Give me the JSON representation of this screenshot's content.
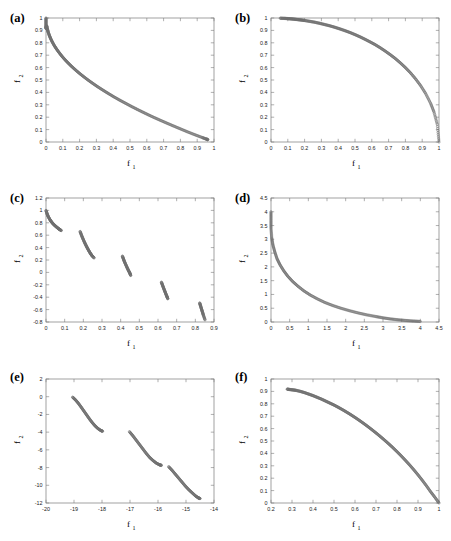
{
  "figure": {
    "caption_style": "six-panel pareto front scatter figure",
    "marker": {
      "shape": "open-circle",
      "color": "#6e6e6e",
      "radius": 1.15
    }
  },
  "panels": [
    {
      "tag": "(a)",
      "xlabel": "f",
      "xlabel_sub": "1",
      "ylabel": "f",
      "ylabel_sub": "2",
      "xticks": [
        "0",
        "0.1",
        "0.2",
        "0.3",
        "0.4",
        "0.5",
        "0.6",
        "0.7",
        "0.8",
        "0.9",
        "1"
      ],
      "yticks": [
        "0",
        "0.1",
        "0.2",
        "0.3",
        "0.4",
        "0.5",
        "0.6",
        "0.7",
        "0.8",
        "0.9",
        "1"
      ],
      "xlim": [
        0,
        1
      ],
      "ylim": [
        0,
        1
      ]
    },
    {
      "tag": "(b)",
      "xlabel": "f",
      "xlabel_sub": "1",
      "ylabel": "f",
      "ylabel_sub": "2",
      "xticks": [
        "0",
        "0.1",
        "0.2",
        "0.3",
        "0.4",
        "0.5",
        "0.6",
        "0.7",
        "0.8",
        "0.9",
        "1"
      ],
      "yticks": [
        "0",
        "0.1",
        "0.2",
        "0.3",
        "0.4",
        "0.5",
        "0.6",
        "0.7",
        "0.8",
        "0.9",
        "1"
      ],
      "xlim": [
        0,
        1
      ],
      "ylim": [
        0,
        1
      ]
    },
    {
      "tag": "(c)",
      "xlabel": "f",
      "xlabel_sub": "1",
      "ylabel": "f",
      "ylabel_sub": "2",
      "xticks": [
        "0",
        "0.1",
        "0.2",
        "0.3",
        "0.4",
        "0.5",
        "0.6",
        "0.7",
        "0.8",
        "0.9"
      ],
      "yticks": [
        "-0.8",
        "-0.6",
        "-0.4",
        "-0.2",
        "0",
        "0.2",
        "0.4",
        "0.6",
        "0.8",
        "1",
        "1.2"
      ],
      "xlim": [
        0,
        0.9
      ],
      "ylim": [
        -0.8,
        1.2
      ]
    },
    {
      "tag": "(d)",
      "xlabel": "f",
      "xlabel_sub": "1",
      "ylabel": "f",
      "ylabel_sub": "2",
      "xticks": [
        "0",
        "0.5",
        "1",
        "1.5",
        "2",
        "2.5",
        "3",
        "3.5",
        "4",
        "4.5"
      ],
      "yticks": [
        "0",
        "0.5",
        "1",
        "1.5",
        "2",
        "2.5",
        "3",
        "3.5",
        "4",
        "4.5"
      ],
      "xlim": [
        0,
        4.5
      ],
      "ylim": [
        0,
        4.5
      ]
    },
    {
      "tag": "(e)",
      "xlabel": "f",
      "xlabel_sub": "1",
      "ylabel": "f",
      "ylabel_sub": "2",
      "xticks": [
        "-20",
        "-19",
        "-18",
        "-17",
        "-16",
        "-15",
        "-14"
      ],
      "yticks": [
        "-12",
        "-10",
        "-8",
        "-6",
        "-4",
        "-2",
        "0",
        "2"
      ],
      "xlim": [
        -20,
        -14
      ],
      "ylim": [
        -12,
        2
      ]
    },
    {
      "tag": "(f)",
      "xlabel": "f",
      "xlabel_sub": "1",
      "ylabel": "f",
      "ylabel_sub": "2",
      "xticks": [
        "0.2",
        "0.3",
        "0.4",
        "0.5",
        "0.6",
        "0.7",
        "0.8",
        "0.9",
        "1"
      ],
      "yticks": [
        "0",
        "0.1",
        "0.2",
        "0.3",
        "0.4",
        "0.5",
        "0.6",
        "0.7",
        "0.8",
        "0.9",
        "1"
      ],
      "xlim": [
        0.2,
        1
      ],
      "ylim": [
        0,
        1
      ]
    }
  ],
  "chart_data": [
    {
      "type": "scatter",
      "panel": "(a)",
      "title": "",
      "xlabel": "f1",
      "ylabel": "f2",
      "xlim": [
        0,
        1
      ],
      "ylim": [
        0,
        1
      ],
      "grid": false,
      "legend": "none",
      "series": [
        {
          "name": "pareto-front-convex",
          "description": "convex decreasing front, f2 = 1 - sqrt(f1)",
          "x": [
            0.0,
            0.0,
            0.0,
            0.0,
            0.004,
            0.008,
            0.013,
            0.02,
            0.028,
            0.038,
            0.05,
            0.063,
            0.078,
            0.094,
            0.112,
            0.131,
            0.152,
            0.174,
            0.198,
            0.223,
            0.25,
            0.278,
            0.307,
            0.338,
            0.37,
            0.403,
            0.438,
            0.474,
            0.511,
            0.549,
            0.588,
            0.628,
            0.669,
            0.711,
            0.754,
            0.798,
            0.842,
            0.887,
            0.93,
            0.955,
            0.963
          ],
          "y": [
            1.0,
            0.97,
            0.94,
            0.915,
            0.937,
            0.911,
            0.886,
            0.859,
            0.833,
            0.805,
            0.776,
            0.749,
            0.721,
            0.693,
            0.665,
            0.638,
            0.61,
            0.583,
            0.555,
            0.528,
            0.5,
            0.473,
            0.446,
            0.419,
            0.392,
            0.365,
            0.338,
            0.312,
            0.285,
            0.259,
            0.233,
            0.207,
            0.182,
            0.157,
            0.132,
            0.107,
            0.082,
            0.058,
            0.036,
            0.023,
            0.019
          ]
        }
      ]
    },
    {
      "type": "scatter",
      "panel": "(b)",
      "title": "",
      "xlabel": "f1",
      "ylabel": "f2",
      "xlim": [
        0,
        1
      ],
      "ylim": [
        0,
        1
      ],
      "grid": false,
      "legend": "none",
      "series": [
        {
          "name": "pareto-front-concave",
          "description": "concave front, f2 = sqrt(1 - f1^2), quarter circle",
          "x": [
            0.055,
            0.08,
            0.1,
            0.12,
            0.14,
            0.16,
            0.18,
            0.2,
            0.23,
            0.26,
            0.29,
            0.32,
            0.35,
            0.38,
            0.41,
            0.44,
            0.47,
            0.5,
            0.53,
            0.56,
            0.59,
            0.62,
            0.65,
            0.68,
            0.71,
            0.74,
            0.77,
            0.8,
            0.83,
            0.86,
            0.89,
            0.92,
            0.95,
            0.97,
            0.99,
            1.0
          ],
          "y": [
            0.998,
            0.997,
            0.995,
            0.993,
            0.99,
            0.987,
            0.984,
            0.98,
            0.973,
            0.966,
            0.957,
            0.947,
            0.937,
            0.925,
            0.912,
            0.898,
            0.883,
            0.866,
            0.848,
            0.828,
            0.807,
            0.785,
            0.76,
            0.733,
            0.704,
            0.673,
            0.638,
            0.6,
            0.558,
            0.51,
            0.456,
            0.392,
            0.312,
            0.243,
            0.141,
            0.0
          ]
        }
      ]
    },
    {
      "type": "scatter",
      "panel": "(c)",
      "title": "",
      "xlabel": "f1",
      "ylabel": "f2",
      "xlim": [
        0,
        0.9
      ],
      "ylim": [
        -0.8,
        1.2
      ],
      "grid": false,
      "legend": "none",
      "series": [
        {
          "name": "segment-1",
          "x": [
            0.0,
            0.006,
            0.012,
            0.02,
            0.028,
            0.036,
            0.045,
            0.054,
            0.063,
            0.072,
            0.0818
          ],
          "y": [
            1.0,
            0.944,
            0.9,
            0.856,
            0.82,
            0.79,
            0.763,
            0.738,
            0.715,
            0.694,
            0.6753
          ]
        },
        {
          "name": "segment-2",
          "x": [
            0.1827,
            0.19,
            0.198,
            0.206,
            0.214,
            0.222,
            0.23,
            0.238,
            0.246,
            0.2577
          ],
          "y": [
            0.6606,
            0.6,
            0.542,
            0.487,
            0.437,
            0.39,
            0.346,
            0.306,
            0.27,
            0.2338
          ]
        },
        {
          "name": "segment-3",
          "x": [
            0.4093,
            0.415,
            0.421,
            0.428,
            0.435,
            0.442,
            0.449,
            0.4538
          ],
          "y": [
            0.2625,
            0.215,
            0.168,
            0.121,
            0.074,
            0.029,
            -0.01,
            -0.0497
          ]
        },
        {
          "name": "segment-4",
          "x": [
            0.6183,
            0.624,
            0.63,
            0.636,
            0.642,
            0.648,
            0.6525
          ],
          "y": [
            -0.1576,
            -0.205,
            -0.253,
            -0.3,
            -0.346,
            -0.39,
            -0.4254
          ]
        },
        {
          "name": "segment-5",
          "x": [
            0.8233,
            0.828,
            0.833,
            0.838,
            0.843,
            0.8518
          ],
          "y": [
            -0.4929,
            -0.54,
            -0.59,
            -0.638,
            -0.688,
            -0.7655
          ]
        }
      ]
    },
    {
      "type": "scatter",
      "panel": "(d)",
      "title": "",
      "xlabel": "f1",
      "ylabel": "f2",
      "xlim": [
        0,
        4.5
      ],
      "ylim": [
        0,
        4.5
      ],
      "grid": false,
      "legend": "none",
      "series": [
        {
          "name": "pareto-front-hyperbolic",
          "description": "strongly convex decaying front",
          "x": [
            0.0,
            0.0,
            0.0,
            0.02,
            0.05,
            0.1,
            0.16,
            0.24,
            0.34,
            0.45,
            0.58,
            0.72,
            0.88,
            1.05,
            1.24,
            1.44,
            1.65,
            1.87,
            2.1,
            2.33,
            2.56,
            2.8,
            3.0,
            3.2,
            3.4,
            3.6,
            3.8,
            4.0
          ],
          "y": [
            4.0,
            3.7,
            3.4,
            3.05,
            2.8,
            2.55,
            2.3,
            2.08,
            1.86,
            1.66,
            1.47,
            1.3,
            1.13,
            0.98,
            0.84,
            0.71,
            0.6,
            0.5,
            0.41,
            0.33,
            0.26,
            0.2,
            0.15,
            0.11,
            0.08,
            0.055,
            0.035,
            0.02
          ]
        }
      ]
    },
    {
      "type": "scatter",
      "panel": "(e)",
      "title": "",
      "xlabel": "f1",
      "ylabel": "f2",
      "xlim": [
        -20,
        -14
      ],
      "ylim": [
        -12,
        2
      ],
      "grid": false,
      "legend": "none",
      "series": [
        {
          "name": "segment-1",
          "x": [
            -19.05,
            -18.95,
            -18.85,
            -18.75,
            -18.65,
            -18.55,
            -18.45,
            -18.35,
            -18.25,
            -18.15,
            -18.05,
            -17.98
          ],
          "y": [
            -0.05,
            -0.35,
            -0.72,
            -1.15,
            -1.6,
            -2.05,
            -2.5,
            -2.92,
            -3.28,
            -3.58,
            -3.8,
            -3.9
          ]
        },
        {
          "name": "segment-2",
          "x": [
            -17.02,
            -16.9,
            -16.78,
            -16.66,
            -16.54,
            -16.42,
            -16.3,
            -16.18,
            -16.06,
            -15.95,
            -15.88
          ],
          "y": [
            -3.95,
            -4.4,
            -4.9,
            -5.4,
            -5.9,
            -6.4,
            -6.85,
            -7.2,
            -7.5,
            -7.68,
            -7.75
          ]
        },
        {
          "name": "segment-3",
          "x": [
            -15.62,
            -15.5,
            -15.38,
            -15.26,
            -15.14,
            -15.02,
            -14.9,
            -14.78,
            -14.66,
            -14.56,
            -14.5
          ],
          "y": [
            -7.9,
            -8.3,
            -8.75,
            -9.2,
            -9.65,
            -10.1,
            -10.5,
            -10.85,
            -11.2,
            -11.42,
            -11.5
          ]
        }
      ]
    },
    {
      "type": "scatter",
      "panel": "(f)",
      "title": "",
      "xlabel": "f1",
      "ylabel": "f2",
      "xlim": [
        0.2,
        1
      ],
      "ylim": [
        0,
        1
      ],
      "grid": false,
      "legend": "none",
      "series": [
        {
          "name": "pareto-front-concave-truncated",
          "x": [
            0.277,
            0.29,
            0.305,
            0.32,
            0.34,
            0.36,
            0.38,
            0.4,
            0.42,
            0.44,
            0.46,
            0.48,
            0.5,
            0.52,
            0.54,
            0.56,
            0.58,
            0.6,
            0.62,
            0.64,
            0.66,
            0.68,
            0.7,
            0.72,
            0.74,
            0.76,
            0.78,
            0.8,
            0.82,
            0.84,
            0.86,
            0.88,
            0.9,
            0.92,
            0.94,
            0.96,
            0.98,
            1.0
          ],
          "y": [
            0.918,
            0.915,
            0.912,
            0.908,
            0.9,
            0.89,
            0.878,
            0.866,
            0.852,
            0.838,
            0.822,
            0.806,
            0.79,
            0.772,
            0.753,
            0.733,
            0.712,
            0.69,
            0.667,
            0.643,
            0.618,
            0.592,
            0.565,
            0.537,
            0.508,
            0.478,
            0.447,
            0.414,
            0.38,
            0.344,
            0.307,
            0.268,
            0.227,
            0.184,
            0.139,
            0.091,
            0.047,
            0.0
          ]
        }
      ]
    }
  ]
}
